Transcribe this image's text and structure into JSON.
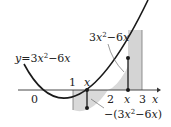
{
  "diagram": {
    "type": "function-graph-area",
    "function_label": "y=3x²−6x",
    "function_label_parts": {
      "prefix": "y",
      "eq": "=",
      "coef": "3",
      "var": "x",
      "exp": "2",
      "rest": "−6",
      "var2": "x"
    },
    "upper_label_parts": {
      "coef": "3",
      "var": "x",
      "exp": "2",
      "rest": "−6",
      "var2": "x"
    },
    "lower_label_parts": {
      "open": "−(3",
      "var": "x",
      "exp": "2",
      "rest": "−6",
      "var2": "x",
      "close": ")"
    },
    "axis": {
      "variable": "x",
      "origin_label": "0"
    },
    "tick_labels": [
      "1",
      "2",
      "3"
    ],
    "sample_x_labels": [
      "x",
      "x"
    ],
    "shaded_intervals": [
      {
        "from": 1,
        "to": 2,
        "position": "below-axis",
        "height_expression": "−(3x²−6x)"
      },
      {
        "from": 2,
        "to": 3,
        "position": "above-axis",
        "height_expression": "3x²−6x"
      }
    ],
    "colors": {
      "curve": "#1a1a1a",
      "shade": "#d9d9d9",
      "shade_dark": "#c4c4c4",
      "axis": "#333333",
      "text": "#222222"
    }
  }
}
